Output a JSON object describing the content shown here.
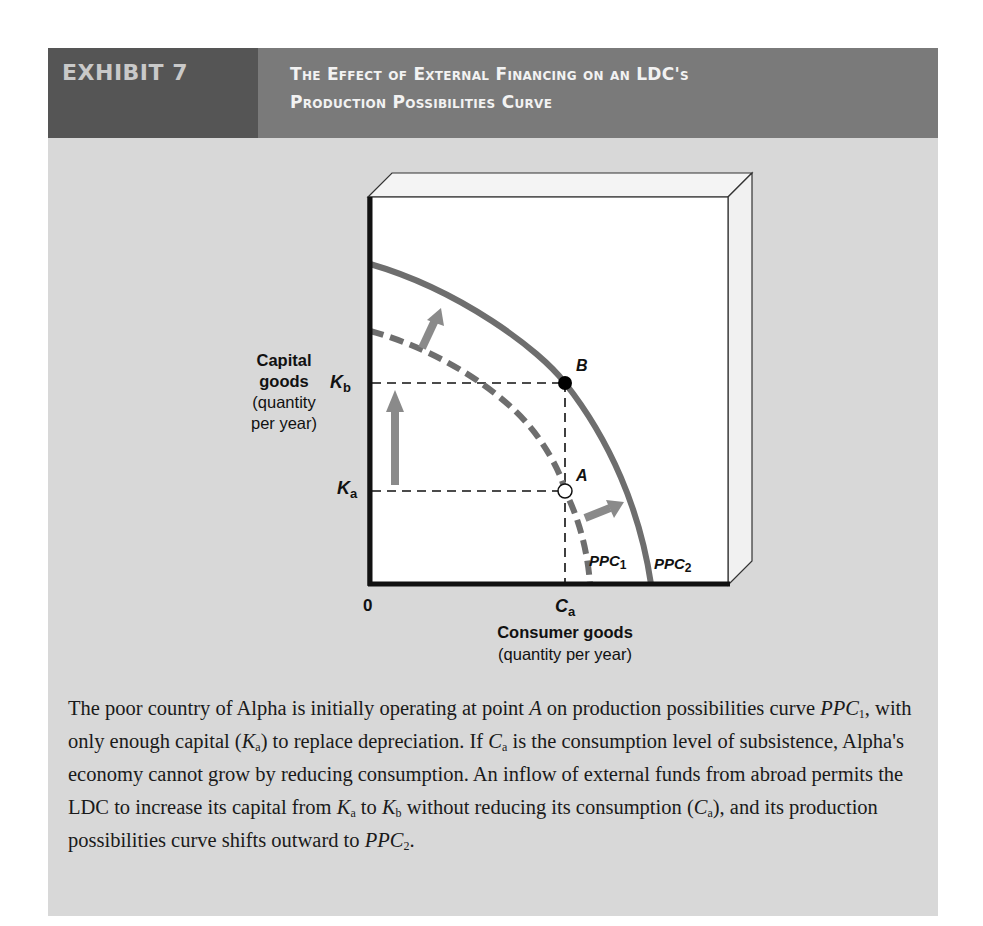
{
  "header": {
    "exhibit_label": "EXHIBIT 7",
    "title_line1": "The Effect of External Financing on an LDC's",
    "title_line2": "Production Possibilities Curve"
  },
  "diagram": {
    "y_axis_label_bold": "Capital goods",
    "y_axis_label_line1": "Capital",
    "y_axis_label_line2": "goods",
    "y_axis_label_line3": "(quantity",
    "y_axis_label_line4": "per year)",
    "x_axis_label_bold": "Consumer goods",
    "x_axis_label_sub": "(quantity per year)",
    "origin_label": "0",
    "ticks": {
      "Kb": {
        "main": "K",
        "sub": "b"
      },
      "Ka": {
        "main": "K",
        "sub": "a"
      },
      "Ca": {
        "main": "C",
        "sub": "a"
      }
    },
    "points": {
      "A": {
        "label": "A",
        "style": "open-circle"
      },
      "B": {
        "label": "B",
        "style": "filled-circle"
      }
    },
    "curves": {
      "PPC1": {
        "main": "PPC",
        "sub": "1",
        "style": "dashed"
      },
      "PPC2": {
        "main": "PPC",
        "sub": "2",
        "style": "solid"
      }
    },
    "colors": {
      "curve": "#6e6e6e",
      "arrow": "#8a8a8a",
      "axis": "#111111",
      "plot_bg": "#ffffff",
      "panel_bg": "#d8d8d8"
    }
  },
  "caption": {
    "segments": [
      "The poor country of Alpha is initially operating at point ",
      "A",
      " on production possibilities curve ",
      "PPC",
      "1",
      ", with only enough capital (",
      "K",
      "a",
      ") to replace depreciation. If ",
      "C",
      "a",
      " is the consumption level of subsistence, Alpha's economy cannot grow by reducing consumption. An inflow of external funds from abroad permits the LDC to increase its capital from ",
      "K",
      "a",
      " to ",
      "K",
      "b",
      " without reducing its consumption (",
      "C",
      "a",
      "), and its production possibilities curve shifts outward to ",
      "PPC",
      "2",
      "."
    ]
  }
}
